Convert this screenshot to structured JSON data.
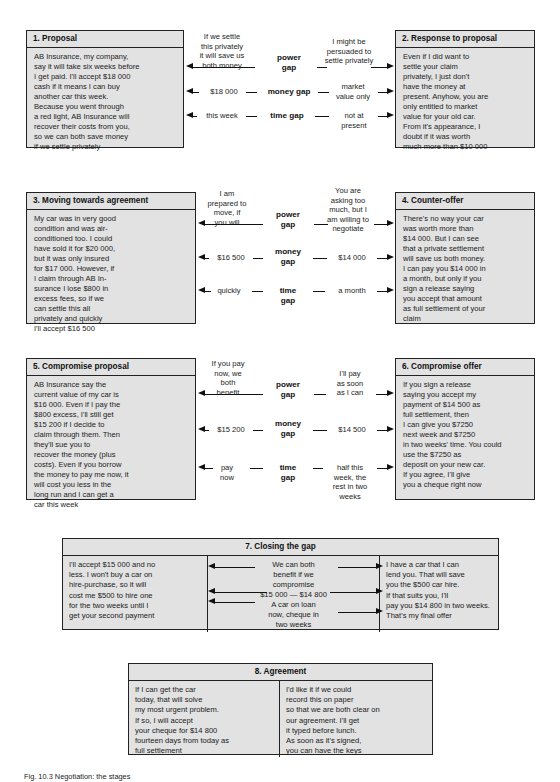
{
  "figure": {
    "caption": "Fig. 10.3  Negotiation: the stages"
  },
  "stages": [
    {
      "id": "stage-1",
      "title": "1. Proposal",
      "body": "AB Insurance, my company,\nsay it will take six weeks before\nI get paid. I'll accept $18 000\ncash if it means I can buy\nanother car this week.\nBecause you went through\na red light, AB Insurance will\nrecover their costs from you,\nso we can both save money\nif we settle privately"
    },
    {
      "id": "stage-2",
      "title": "2. Response to proposal",
      "body": "Even if I did want to\nsettle your claim\nprivately, I just don't\nhave the money at\npresent. Anyhow, you are\nonly entitled to market\nvalue for your old car.\nFrom it's appearance, I\ndoubt if it was worth\nmuch more than $10 000"
    },
    {
      "id": "stage-3",
      "title": "3. Moving towards agreement",
      "body": "My car was in very good\ncondition and was air-\nconditioned too. I could\nhave sold it for $20 000,\nbut it was only insured\nfor $17 000. However, if\nI claim through AB In-\nsurance I lose $800 in\nexcess fees, so if we\ncan settle this all\nprivately and quickly\nI'll accept $16 500"
    },
    {
      "id": "stage-4",
      "title": "4. Counter-offer",
      "body": "There's no way your car\nwas worth more than\n$14 000. But I can see\nthat a private settlement\nwill save us both money.\nI can pay you $14 000 in\na month, but only if you\nsign a release saying\nyou accept that amount\nas full settlement of your\nclaim"
    },
    {
      "id": "stage-5",
      "title": "5. Compromise proposal",
      "body": "AB Insurance say the\ncurrent value of my car is\n$16 000. Even if I pay the\n$800 excess, I'll still get\n$15 200 if I decide to\nclaim through them. Then\nthey'll sue you to\nrecover the money (plus\ncosts). Even if you borrow\nthe money to pay me now, it\nwill cost you less in the\nlong run and I can get a\ncar this week"
    },
    {
      "id": "stage-6",
      "title": "6. Compromise offer",
      "body": "If you sign a release\nsaying you accept my\npayment of $14 500 as\nfull settlement, then\nI can give you $7250\nnext week and $7250\nin two weeks' time. You could\nuse the $7250 as\ndeposit on your new car.\nIf you agree, I'll give\nyou a cheque right now"
    }
  ],
  "gap_rows": [
    {
      "id": "row-1",
      "left_party": {
        "power": "If we settle\nthis privately\nit will save us\nboth money",
        "money": "$18 000",
        "time": "this week"
      },
      "gaps": {
        "power": "power\ngap",
        "money": "money gap",
        "time": "time gap"
      },
      "right_party": {
        "power": "I might be\npersuaded to\nsettle privately",
        "money": "market\nvalue only",
        "time": "not at\npresent"
      }
    },
    {
      "id": "row-2",
      "left_party": {
        "power": "I am\nprepared to\nmove, if\nyou will",
        "money": "$16 500",
        "time": "quickly"
      },
      "gaps": {
        "power": "power\ngap",
        "money": "money\ngap",
        "time": "time\ngap"
      },
      "right_party": {
        "power": "You are\nasking too\nmuch, but I\nam willing to\nnegotiate",
        "money": "$14 000",
        "time": "a month"
      }
    },
    {
      "id": "row-3",
      "left_party": {
        "power": "If you pay\nnow, we\nboth\nbenefit",
        "money": "$15 200",
        "time": "pay\nnow"
      },
      "gaps": {
        "power": "power\ngap",
        "money": "money\ngap",
        "time": "time\ngap"
      },
      "right_party": {
        "power": "I'll pay\nas soon\nas I can",
        "money": "$14 500",
        "time": "half this\nweek, the\nrest in two\nweeks"
      }
    }
  ],
  "closing": {
    "title": "7. Closing the gap",
    "left": "I'll accept $15 000 and no\nless. I won't buy a car on\nhire-purchase, so it will\ncost me $500 to hire one\nfor the two weeks until I\nget your second payment",
    "middle_line_1": "We can both\nbenefit if we\ncompromise",
    "middle_line_2": "$15 000 — $14 800",
    "middle_line_3": "A car on loan\nnow, cheque in\ntwo weeks",
    "right": "I have a car that I can\nlend you. That will save\nyou the $500 car hire.\nIf that suits you, I'll\npay you $14 800 in two weeks.\nThat's my final offer"
  },
  "agreement": {
    "title": "8. Agreement",
    "left": "If I can get the car\ntoday, that will solve\nmy most urgent problem.\nIf so, I will accept\nyour cheque for $14 800\nfourteen days from today as\nfull settlement",
    "right": "I'd like it if we could\nrecord this on paper\nso that we are both clear on\nour agreement. I'll get\nit typed before lunch.\nAs soon as it's signed,\nyou can have the keys"
  },
  "colors": {
    "panel_fill": "#e2e2e2",
    "ink": "#111111",
    "page": "#ffffff"
  }
}
